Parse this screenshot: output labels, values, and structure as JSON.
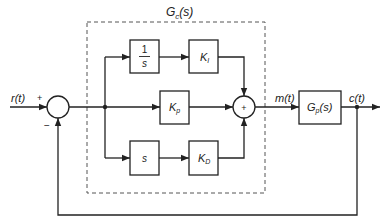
{
  "controller_label": "G",
  "controller_label_sub": "c",
  "controller_label_suffix": "(s)",
  "signals": {
    "input": "r(t)",
    "manipulated": "m(t)",
    "output": "c(t)"
  },
  "blocks": {
    "integrator_num": "1",
    "integrator_den": "s",
    "integral_gain": "K",
    "integral_gain_sub": "I",
    "proportional_gain": "K",
    "proportional_gain_sub": "p",
    "derivative": "s",
    "derivative_gain": "K",
    "derivative_gain_sub": "D",
    "plant": "G",
    "plant_sub": "p",
    "plant_suffix": "(s)"
  },
  "summing_junctions": {
    "error_plus": "+",
    "error_minus": "−",
    "pid_sum": "+"
  },
  "colors": {
    "line": "#222222",
    "dashed": "#555555",
    "background": "#ffffff"
  }
}
